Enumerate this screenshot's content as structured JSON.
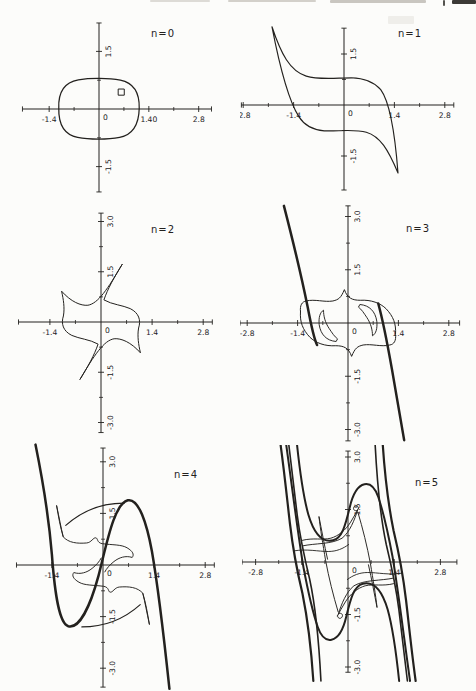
{
  "palette": {
    "paper": "#fcfcfa",
    "ink": "#23211e"
  },
  "chart_data": {
    "type": "line",
    "figure": "six-panel phase portraits, successive iterates n=0 to n=5 of a closed curve",
    "grid": false,
    "panels": [
      {
        "id": "n0",
        "label": "n=0",
        "label_px": [
          131,
          23
        ],
        "box": {
          "x": 20,
          "y": 14,
          "w": 216,
          "h": 186
        },
        "origin": [
          79,
          95
        ],
        "scale": [
          35.6,
          38.4
        ],
        "x_range": [
          -2.15,
          3.16
        ],
        "y_range": [
          -2.16,
          2.24
        ],
        "x_major": [
          {
            "v": -1.4,
            "t": "-1.4"
          },
          {
            "v": 1.4,
            "t": "1.40"
          },
          {
            "v": 2.8,
            "t": "2.8"
          }
        ],
        "x_minor": [
          -0.7,
          0.7,
          2.1
        ],
        "y_major": [
          {
            "v": 1.5,
            "t": "1.5"
          },
          {
            "v": -1.5,
            "t": "-1.5"
          }
        ],
        "y_minor": [
          -0.75,
          0.75
        ],
        "origin_label": "0",
        "curves": [
          {
            "name": "initial-oval",
            "w": 1.25,
            "d": "M -1.13,0.02 C -1.15,0.45 -0.95,0.7 -0.58,0.76 C -0.25,0.81 0.28,0.81 0.6,0.75 C 0.97,0.68 1.14,0.44 1.13,0.02 C 1.12,-0.42 0.95,-0.67 0.58,-0.74 C 0.25,-0.8 -0.28,-0.8 -0.6,-0.74 C -0.97,-0.67 -1.14,-0.42 -1.13,0.02 Z"
          },
          {
            "name": "seed-square-marker",
            "w": 1.0,
            "d": "M 0.55,0.36 L 0.71,0.36 L 0.71,0.52 L 0.55,0.52 Z"
          }
        ]
      },
      {
        "id": "n1",
        "label": "n=1",
        "label_px": [
          158,
          23
        ],
        "box": {
          "x": 240,
          "y": 14,
          "w": 236,
          "h": 186
        },
        "origin": [
          104,
          91
        ],
        "scale": [
          36,
          34
        ],
        "x_range": [
          -2.85,
          3.05
        ],
        "y_range": [
          -2.5,
          2.26
        ],
        "x_major": [
          {
            "v": -2.8,
            "t": "-2.8"
          },
          {
            "v": -1.4,
            "t": "-1.4"
          },
          {
            "v": 1.4,
            "t": "1.4"
          },
          {
            "v": 2.8,
            "t": "2.8"
          }
        ],
        "x_minor": [
          -2.1,
          -0.7,
          0.7,
          2.1
        ],
        "y_major": [
          {
            "v": 1.5,
            "t": "1.5"
          },
          {
            "v": -1.5,
            "t": "-1.5"
          }
        ],
        "y_minor": [
          -0.75,
          0.75
        ],
        "origin_label": "0",
        "curves": [
          {
            "name": "iterate-band",
            "w": 1.15,
            "d": "M -2.0,2.3 C -1.75,1.5 -1.5,1.0 -1.05,0.85 C -0.7,0.73 -0.2,0.8 0.2,0.8 C 0.6,0.79 0.85,0.66 1.02,0.45 C 1.3,0.05 1.42,-0.9 1.5,-2.0 C 1.22,-1.3 1.0,-0.92 0.62,-0.8 C 0.28,-0.7 -0.2,-0.78 -0.55,-0.76 C -0.9,-0.73 -1.1,-0.6 -1.25,-0.35 C -1.55,0.15 -1.8,1.2 -2.0,2.3 Z"
          }
        ]
      },
      {
        "id": "n2",
        "label": "n=2",
        "label_px": [
          133,
          25
        ],
        "box": {
          "x": 18,
          "y": 208,
          "w": 220,
          "h": 237
        },
        "origin": [
          83,
          114
        ],
        "scale": [
          36.5,
          33.5
        ],
        "x_range": [
          -2.26,
          3.05
        ],
        "y_range": [
          -3.3,
          3.25
        ],
        "x_major": [
          {
            "v": -1.4,
            "t": "-1.4"
          },
          {
            "v": 1.4,
            "t": "1.4"
          },
          {
            "v": 2.8,
            "t": "2.8"
          }
        ],
        "x_minor": [
          -0.7,
          0.7,
          2.1
        ],
        "y_major": [
          {
            "v": 3.0,
            "t": "3.0"
          },
          {
            "v": 1.5,
            "t": "1.5"
          },
          {
            "v": -1.5,
            "t": "-1.5"
          },
          {
            "v": -3.0,
            "t": "-3.0"
          }
        ],
        "y_minor": [
          -2.25,
          -0.75,
          0.75,
          2.25
        ],
        "origin_label": "0",
        "curves": [
          {
            "name": "pinwheel-band",
            "w": 1.0,
            "d": "M 0.58,1.72 C 0.36,1.34 0.18,0.98 0.08,0.66 C 0.3,0.52 0.6,0.5 0.8,0.4 C 1.04,0.27 1.1,0.05 1.03,-0.18 C 0.99,-0.42 1.03,-0.68 1.08,-0.92 C 0.82,-0.6 0.55,-0.48 0.36,-0.5 C 0.08,-0.55 -0.18,-0.98 -0.58,-1.72 C -0.36,-1.34 -0.18,-0.98 -0.08,-0.66 C -0.3,-0.52 -0.6,-0.5 -0.8,-0.4 C -1.04,-0.27 -1.1,-0.05 -1.03,0.18 C -0.99,0.42 -1.03,0.68 -1.08,0.92 C -0.82,0.6 -0.55,0.48 -0.36,0.5 C -0.08,0.55 0.18,0.98 0.58,1.72 Z"
          }
        ]
      },
      {
        "id": "n3",
        "label": "n=3",
        "label_px": [
          166,
          32
        ],
        "box": {
          "x": 240,
          "y": 200,
          "w": 236,
          "h": 245
        },
        "origin": [
          108,
          123
        ],
        "scale": [
          36,
          35.5
        ],
        "x_range": [
          -3.0,
          3.1
        ],
        "y_range": [
          -3.32,
          3.3
        ],
        "x_major": [
          {
            "v": -2.8,
            "t": "-2.8"
          },
          {
            "v": -1.4,
            "t": "-1.4"
          },
          {
            "v": 1.4,
            "t": "1.4"
          },
          {
            "v": 2.8,
            "t": "2.8"
          }
        ],
        "x_minor": [
          -2.1,
          -0.7,
          0.7,
          2.1
        ],
        "y_major": [
          {
            "v": 3.0,
            "t": "3.0"
          },
          {
            "v": 1.5,
            "t": "1.5"
          },
          {
            "v": -1.5,
            "t": "-1.5"
          },
          {
            "v": -3.0,
            "t": "-3.0"
          }
        ],
        "y_minor": [
          -2.25,
          -0.75,
          0.75,
          2.25
        ],
        "origin_label": "0",
        "curves": [
          {
            "name": "unstable-strand-left",
            "w": 2.5,
            "d": "M -1.78,3.3 C -1.5,2.2 -1.28,1.25 -1.12,0.45 C -1.0,-0.2 -0.94,-0.45 -0.86,-0.62"
          },
          {
            "name": "unstable-strand-right",
            "w": 2.5,
            "d": "M 0.84,0.55 C 0.95,0.15 1.08,-0.5 1.22,-1.3 C 1.36,-2.1 1.46,-2.7 1.56,-3.3"
          },
          {
            "name": "folded-band-outline",
            "w": 1.0,
            "d": "M -1.32,0.32 C -1.34,0.5 -1.28,0.6 -1.16,0.62 C -0.92,0.68 -0.66,0.58 -0.42,0.62 C -0.26,0.66 -0.2,0.7 -0.1,0.94 C -0.02,0.7 0.12,0.64 0.34,0.64 C 0.64,0.66 0.9,0.56 1.06,0.4 C 1.26,0.18 1.34,-0.02 1.32,-0.32 C 1.34,-0.5 1.28,-0.6 1.16,-0.62 C 0.92,-0.68 0.66,-0.58 0.42,-0.62 C 0.26,-0.66 0.2,-0.7 0.1,-0.94 C 0.02,-0.7 -0.12,-0.64 -0.34,-0.64 C -0.64,-0.66 -0.9,-0.56 -1.06,-0.4 C -1.26,-0.18 -1.34,0.02 -1.32,0.32 Z"
          },
          {
            "name": "fold-hook-right",
            "w": 0.95,
            "d": "M 0.34,0.52 C 0.6,0.5 0.76,0.32 0.8,0.05 C 0.82,-0.15 0.78,-0.3 0.68,-0.36 C 0.68,-0.2 0.64,-0.02 0.52,0.16 C 0.44,0.28 0.38,0.38 0.3,0.44 Z"
          },
          {
            "name": "fold-hook-left",
            "w": 0.95,
            "d": "M -0.34,-0.52 C -0.6,-0.5 -0.76,-0.32 -0.8,-0.05 C -0.82,0.15 -0.78,0.3 -0.68,0.36 C -0.68,0.2 -0.64,0.02 -0.52,-0.16 C -0.44,-0.28 -0.38,-0.38 -0.3,-0.44 Z"
          }
        ]
      },
      {
        "id": "n4",
        "label": "n=4",
        "label_px": [
          166,
          36
        ],
        "box": {
          "x": 8,
          "y": 442,
          "w": 236,
          "h": 249
        },
        "origin": [
          95,
          123
        ],
        "scale": [
          36.5,
          34.4
        ],
        "x_range": [
          -2.37,
          3.05
        ],
        "y_range": [
          -3.55,
          3.4
        ],
        "x_major": [
          {
            "v": -1.4,
            "t": "-1.4"
          },
          {
            "v": 1.4,
            "t": "1.4"
          },
          {
            "v": 2.8,
            "t": "2.8"
          }
        ],
        "x_minor": [
          -0.7,
          0.7,
          2.1
        ],
        "y_major": [
          {
            "v": 3.0,
            "t": "3.0"
          },
          {
            "v": 1.5,
            "t": "1.5"
          },
          {
            "v": -1.5,
            "t": "-1.5"
          },
          {
            "v": -3.0,
            "t": "-3.0"
          }
        ],
        "y_minor": [
          -2.25,
          -0.75,
          0.75,
          2.25
        ],
        "origin_label": "0",
        "curves": [
          {
            "name": "stretched-s-curve",
            "w": 2.5,
            "d": "M -1.85,3.5 C -1.62,2.3 -1.47,1.2 -1.4,0.3 C -1.32,-0.85 -1.2,-1.7 -0.95,-1.78 C -0.65,-1.86 -0.35,-1.2 -0.12,-0.3 C 0.1,0.6 0.3,1.78 0.68,1.88 C 0.98,1.95 1.2,1.2 1.34,0.4 C 1.52,-0.7 1.68,-2.2 1.82,-3.6"
          },
          {
            "name": "fold-needle-upper",
            "w": 0.95,
            "d": "M -1.27,1.72 C -1.2,1.38 -1.15,1.08 -1.09,0.82 C -1.17,1.1 -1.22,1.4 -1.27,1.72 Z"
          },
          {
            "name": "fold-band-upper",
            "w": 0.95,
            "d": "M -1.09,0.82 C -0.95,0.64 -0.7,0.62 -0.45,0.64 C -0.32,0.65 -0.27,0.8 -0.2,0.79 C -0.13,0.78 -0.18,0.65 -0.02,0.62 C 0.25,0.58 0.5,0.6 0.66,0.5 C 0.82,0.4 0.86,0.3 0.8,0.22 C 0.62,0.28 0.44,0.22 0.3,0.1 C 0.18,0.0 0.1,-0.1 0.05,-0.2"
          },
          {
            "name": "fold-band-lower",
            "w": 0.95,
            "d": "M 1.09,-0.82 C 0.95,-0.64 0.7,-0.62 0.45,-0.64 C 0.32,-0.65 0.27,-0.8 0.2,-0.79 C 0.13,-0.78 0.18,-0.65 0.02,-0.62 C -0.25,-0.58 -0.5,-0.6 -0.66,-0.5 C -0.82,-0.4 -0.86,-0.3 -0.8,-0.22 C -0.62,-0.28 -0.44,-0.22 -0.3,-0.1 C -0.18,0.0 -0.1,0.1 -0.05,0.2"
          },
          {
            "name": "fold-needle-lower",
            "w": 0.95,
            "d": "M 1.27,-1.72 C 1.2,-1.38 1.15,-1.08 1.09,-0.82 C 1.17,-1.1 1.22,-1.4 1.27,-1.72 Z"
          },
          {
            "name": "inner-shadow-upper",
            "w": 1.1,
            "d": "M -1.02,1.15 C -0.6,1.55 -0.05,1.8 0.58,1.8"
          },
          {
            "name": "inner-shadow-lower",
            "w": 1.1,
            "d": "M 1.02,-1.15 C 0.6,-1.55 0.05,-1.8 -0.58,-1.8"
          }
        ]
      },
      {
        "id": "n5",
        "label": "n=5",
        "label_px": [
          173,
          41
        ],
        "box": {
          "x": 242,
          "y": 445,
          "w": 234,
          "h": 246
        },
        "origin": [
          106,
          117
        ],
        "scale": [
          33,
          35
        ],
        "x_range": [
          -3.21,
          3.3
        ],
        "y_range": [
          -3.15,
          3.17
        ],
        "x_major": [
          {
            "v": -2.8,
            "t": "-2.8"
          },
          {
            "v": -1.4,
            "t": "-1.4"
          },
          {
            "v": 1.4,
            "t": "1.4"
          },
          {
            "v": 2.8,
            "t": "2.8"
          }
        ],
        "x_minor": [
          -2.1,
          -0.7,
          0.7,
          2.1
        ],
        "y_major": [
          {
            "v": 3.0,
            "t": "3.0"
          },
          {
            "v": 1.5,
            "t": "1.5"
          },
          {
            "v": -1.5,
            "t": "-1.5"
          },
          {
            "v": -3.0,
            "t": "-3.0"
          }
        ],
        "y_minor": [
          -2.25,
          -0.75,
          0.75,
          2.25
        ],
        "origin_label": "0",
        "curves": [
          {
            "name": "strand-left-outer",
            "w": 2.2,
            "d": "M -2.05,3.4 C -1.92,2.5 -1.84,1.75 -1.76,1.1 C -1.66,0.3 -1.52,-0.35 -1.38,-0.9 C -1.24,-1.55 -1.12,-2.4 -1.05,-3.4"
          },
          {
            "name": "strand-left-mid",
            "w": 1.6,
            "d": "M -1.8,3.4 C -1.7,2.6 -1.62,1.95 -1.54,1.35 C -1.44,0.6 -1.3,0.05 -1.16,-0.5 C -1.0,-1.2 -0.88,-2.3 -0.82,-3.4"
          },
          {
            "name": "strand-right-outer",
            "w": 2.2,
            "d": "M 2.05,-3.4 C 1.92,-2.5 1.84,-1.75 1.76,-1.1 C 1.66,-0.3 1.52,0.35 1.38,0.9 C 1.24,1.55 1.12,2.4 1.05,3.4"
          },
          {
            "name": "strand-right-mid",
            "w": 1.6,
            "d": "M 1.8,-3.4 C 1.7,-2.6 1.62,-1.95 1.54,-1.35 C 1.44,-0.6 1.3,-0.05 1.16,0.5 C 1.0,1.2 0.88,2.3 0.82,3.4"
          },
          {
            "name": "envelope-top",
            "w": 2.0,
            "d": "M -1.55,3.4 C -1.45,2.5 -1.35,1.85 -1.2,1.35 C -1.02,0.78 -0.75,0.55 -0.45,0.62 C -0.18,0.68 -0.08,1.05 0.05,1.55 C 0.14,1.92 0.3,2.18 0.5,2.22 C 0.7,2.26 0.82,2.12 0.92,1.85 C 1.08,1.4 1.22,0.8 1.35,0.15 C 1.52,-0.8 1.7,-2.2 1.88,-3.4"
          },
          {
            "name": "envelope-bottom",
            "w": 2.0,
            "d": "M 1.55,-3.4 C 1.45,-2.5 1.35,-1.85 1.2,-1.35 C 1.02,-0.78 0.75,-0.55 0.45,-0.62 C 0.18,-0.68 0.08,-1.05 -0.05,-1.55 C -0.14,-1.92 -0.3,-2.18 -0.5,-2.22 C -0.7,-2.26 -0.82,-2.12 -0.92,-1.85 C -1.08,-1.4 -1.22,-0.8 -1.35,-0.15 C -1.52,0.8 -1.7,2.2 -1.88,3.4"
          },
          {
            "name": "dart-upper-edge",
            "w": 0.95,
            "d": "M -1.38,0.62 C -1.05,0.7 -0.78,0.62 -0.52,0.68 C -0.3,0.74 -0.08,0.9 0.08,1.14 C 0.18,1.3 0.27,1.44 0.32,1.54"
          },
          {
            "name": "dart-upper-curl",
            "w": 0.95,
            "d": "M 0.32,1.54 C 0.3,1.64 0.2,1.63 0.17,1.55 C 0.15,1.48 0.23,1.44 0.29,1.48"
          },
          {
            "name": "dart-upper-return",
            "w": 0.95,
            "d": "M 0.29,1.48 C 0.2,1.2 0.05,0.85 -0.18,0.68 C -0.5,0.5 -1.0,0.54 -1.38,0.46"
          },
          {
            "name": "dart-upper-needle",
            "w": 0.95,
            "d": "M 0.3,1.42 C 0.45,0.95 0.58,0.45 0.68,-0.05 C 0.76,-0.5 0.84,-0.95 0.88,-1.3 C 0.8,-0.92 0.72,-0.5 0.62,-0.08"
          },
          {
            "name": "dart-lower-edge",
            "w": 0.95,
            "d": "M 1.38,-0.62 C 1.05,-0.7 0.78,-0.62 0.52,-0.68 C 0.3,-0.74 0.08,-0.9 -0.08,-1.14 C -0.18,-1.3 -0.27,-1.44 -0.32,-1.54"
          },
          {
            "name": "dart-lower-curl",
            "w": 0.95,
            "d": "M -0.32,-1.54 C -0.3,-1.64 -0.2,-1.63 -0.17,-1.55 C -0.15,-1.48 -0.23,-1.44 -0.29,-1.48"
          },
          {
            "name": "dart-lower-return",
            "w": 0.95,
            "d": "M -0.29,-1.48 C -0.2,-1.2 -0.05,-0.85 0.18,-0.68 C 0.5,-0.5 1.0,-0.54 1.38,-0.46"
          },
          {
            "name": "dart-lower-needle",
            "w": 0.95,
            "d": "M -0.3,-1.42 C -0.45,-0.95 -0.58,-0.45 -0.68,0.05 C -0.76,0.5 -0.84,0.95 -0.88,1.3 C -0.8,0.92 -0.72,0.5 -0.62,0.08"
          },
          {
            "name": "mid-wave-upper",
            "w": 0.9,
            "d": "M -1.62,0.32 C -1.25,0.38 -0.9,0.3 -0.6,0.3 C -0.35,0.3 -0.15,0.38 0.02,0.5"
          },
          {
            "name": "mid-wave-lower",
            "w": 0.9,
            "d": "M 1.62,-0.32 C 1.25,-0.38 0.9,-0.3 0.6,-0.3 C 0.35,-0.3 0.15,-0.38 -0.02,-0.5"
          }
        ]
      }
    ]
  }
}
